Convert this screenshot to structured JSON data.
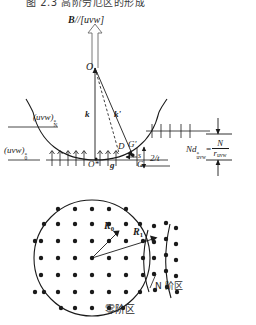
{
  "figure": {
    "caption_top": "图 2.3 高阶劳厄区的形成",
    "domain_note": "Ewald sphere construction and higher-order Laue zone diffraction pattern"
  },
  "upper_diagram": {
    "name": "ewald-sphere-construction",
    "beam_label": "B//[uvw]",
    "beam_label_bold_part": "B",
    "beam_label_rest": "//[uvw]",
    "origin_point": "O",
    "vector_incident": "k",
    "vector_diffracted": "k'",
    "point_D": "D",
    "point_G_prime": "G'",
    "point_G": "G",
    "point_O_star": "O*",
    "vector_g": "g",
    "deviation_s": "s",
    "thickness_extent": "2/t",
    "layer_N": {
      "base": "(uvw)",
      "superscript": "*",
      "subscript": "N"
    },
    "layer_0": {
      "base": "(uvw)",
      "superscript": "*",
      "subscript": "0"
    },
    "spacing_formula": {
      "lhs_base": "Nd",
      "lhs_sup": "*",
      "lhs_sub": "uvw",
      "equals": "=",
      "num": "N",
      "den_base": "r",
      "den_sub": "uvw"
    }
  },
  "lower_diagram": {
    "name": "laue-zone-pattern",
    "radius_zero": "R",
    "radius_zero_sub": "0",
    "radius_n": "R",
    "radius_n_sub": "1",
    "zone_n_label": "N 阶区",
    "zone_zero_label": "零阶区"
  },
  "colors": {
    "ink": "#1a1a1a",
    "paper": "#ffffff",
    "grey_ink": "#3a3a3a"
  }
}
